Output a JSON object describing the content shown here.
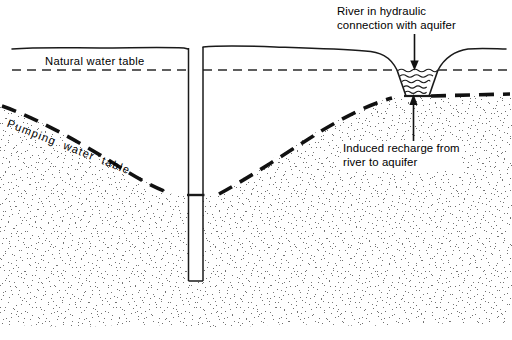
{
  "figure": {
    "type": "hydrogeology-cross-section",
    "width": 512,
    "height": 340,
    "background_color": "#ffffff",
    "line_color": "#000000",
    "stipple_color": "#6b6b6b"
  },
  "labels": {
    "natural_water_table": "Natural water table",
    "pumping_water_table": "Pumping  water  table",
    "river_connection_line1": "River in hydraulic",
    "river_connection_line2": "connection with aquifer",
    "induced_recharge_line1": "Induced recharge from",
    "induced_recharge_line2": "river to aquifer"
  },
  "features": {
    "ground_surface": "ground-surface-line",
    "natural_water_table_line": "dashed-thin-horizontal",
    "pumping_water_table_line": "dashed-thick-cone-of-depression",
    "well": {
      "name": "pumping-well",
      "left_x": 188,
      "right_x": 203,
      "top_y": 48,
      "bottom_y": 281,
      "water_level_y": 195
    },
    "river": {
      "name": "river-channel",
      "shape": "trapezoid",
      "wave_lines": 5,
      "top_left_x": 397,
      "top_right_x": 438,
      "bottom_left_x": 406,
      "bottom_right_x": 429,
      "surface_y": 70,
      "bed_y": 96
    },
    "arrows": {
      "down_arrow": "river-connection-pointer",
      "up_arrow": "induced-recharge-pointer"
    },
    "aquifer": "stippled-sand-aquifer"
  },
  "geometry": {
    "natural_water_table_y": 70,
    "ground_left_y": 48,
    "ground_right_y": 51,
    "aquifer_bottom_y": 325
  }
}
